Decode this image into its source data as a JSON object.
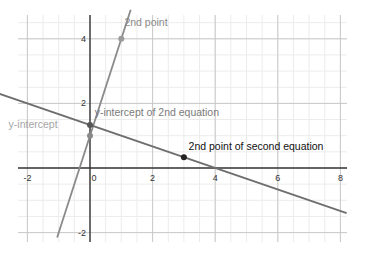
{
  "chart_data": {
    "type": "line",
    "title": "",
    "xlabel": "",
    "ylabel": "",
    "xlim": [
      -2.2,
      8.2
    ],
    "ylim": [
      -2.3,
      5.0
    ],
    "grid": true,
    "x_ticks": [
      -2,
      0,
      2,
      4,
      6,
      8
    ],
    "y_ticks": [
      -2,
      2,
      4
    ],
    "x_tick_labels": [
      "-2",
      "0",
      "2",
      "4",
      "6",
      "8"
    ],
    "y_tick_labels": [
      "-2",
      "2",
      "4"
    ],
    "series": [
      {
        "name": "line 1 (y = 3x + 1)",
        "slope": 3,
        "intercept": 1,
        "x": [
          -1.05,
          1.3
        ],
        "y": [
          -2.15,
          4.9
        ],
        "color": "#8a8a8a"
      },
      {
        "name": "line 2 (y = -x/3 + 4/3)",
        "slope": -0.3333,
        "intercept": 1.3333,
        "x": [
          -2.9,
          8.2
        ],
        "y": [
          2.3,
          -1.4
        ],
        "color": "#6e6e6e"
      }
    ],
    "points": [
      {
        "label": "y-intercept",
        "x": 0,
        "y": 1,
        "color": "#8a8a8a"
      },
      {
        "label": "2nd point",
        "x": 1,
        "y": 4,
        "color": "#9a9a9a"
      },
      {
        "label": "y-intercept of 2nd equation",
        "x": 0,
        "y": 1.333,
        "color": "#555555"
      },
      {
        "label": "2nd point of second equation",
        "x": 3,
        "y": 0.333,
        "color": "#222222"
      }
    ],
    "annotations": [
      {
        "text": "2nd point",
        "x": 1.1,
        "y": 4.4,
        "color": "#8a8a8a"
      },
      {
        "text": "y-intercept of 2nd equation",
        "x": 0.15,
        "y": 1.6,
        "color": "#7a7a7a"
      },
      {
        "text": "y-intercept",
        "x": -2.6,
        "y": 1.25,
        "color": "#a5a5a5"
      },
      {
        "text": "2nd point of second equation",
        "x": 3.15,
        "y": 0.55,
        "color": "#111111"
      }
    ]
  }
}
